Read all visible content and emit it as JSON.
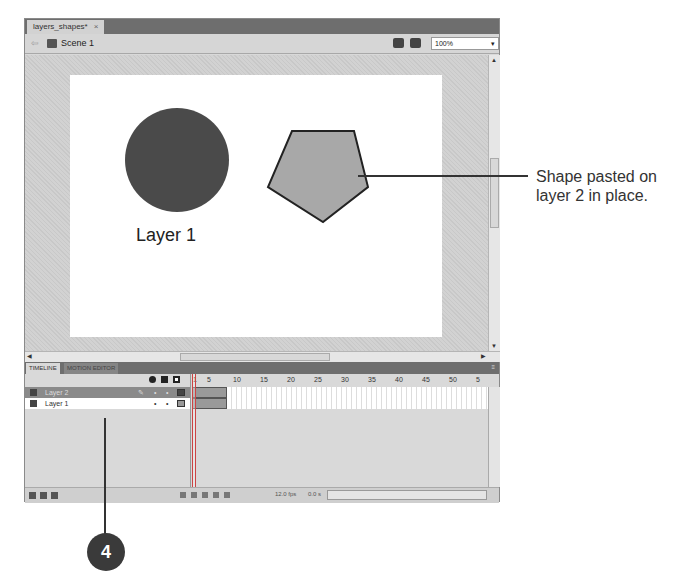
{
  "document": {
    "tab_label": "layers_shapes*",
    "close_glyph": "×"
  },
  "scene_bar": {
    "back_glyph": "⇦",
    "scene_label": "Scene 1",
    "zoom_value": "100%",
    "zoom_arrow": "▾"
  },
  "stage": {
    "shapes": [
      {
        "type": "circle",
        "layer": "Layer 1",
        "color": "#4a4a4a"
      },
      {
        "type": "pentagon",
        "layer": "Layer 2",
        "color": "#a8a8a8",
        "stroke": "#222222"
      }
    ],
    "label": "Layer 1"
  },
  "panel_tabs": [
    {
      "label": "TIMELINE",
      "active": true
    },
    {
      "label": "MOTION EDITOR",
      "active": false
    }
  ],
  "panel_menu_glyph": "≡",
  "timeline": {
    "header_icons": [
      "eye-icon",
      "lock-icon",
      "outline-icon"
    ],
    "layers": [
      {
        "name": "Layer 2",
        "selected": true,
        "pencil": "✎",
        "dot1": "•",
        "dot2": "•"
      },
      {
        "name": "Layer 1",
        "selected": false,
        "pencil": "",
        "dot1": "•",
        "dot2": "•"
      }
    ],
    "ruler_ticks": [
      "1",
      "5",
      "10",
      "15",
      "20",
      "25",
      "30",
      "35",
      "40",
      "45",
      "50",
      "5"
    ],
    "fps": "12.0 fps",
    "time": "0.0 s"
  },
  "annotations": {
    "callout_text_line1": "Shape pasted on",
    "callout_text_line2": "layer 2 in place.",
    "step_number": "4"
  }
}
